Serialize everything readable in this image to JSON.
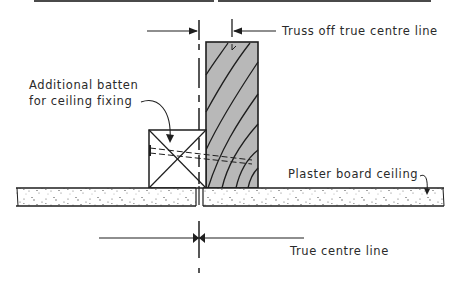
{
  "diagram": {
    "type": "construction-detail",
    "labels": {
      "truss_offset": "Truss off true centre line",
      "batten_line1": "Additional batten",
      "batten_line2": "for ceiling fixing",
      "plaster": "Plaster board  ceiling",
      "centre": "True centre line"
    },
    "components": [
      {
        "name": "truss",
        "description": "Timber truss member with grain hatching, shown offset from centre line"
      },
      {
        "name": "batten",
        "description": "Additional timber batten (crossed section) beside truss"
      },
      {
        "name": "plasterboard",
        "description": "Plaster board ceiling in two sheets jointed at centre line"
      },
      {
        "name": "nail",
        "description": "Dashed fixing through batten into truss"
      }
    ],
    "colors": {
      "line": "#1e1e1e",
      "truss_fill": "#b8b8b8",
      "board_fill": "#ffffff",
      "speckle": "#555555"
    }
  }
}
